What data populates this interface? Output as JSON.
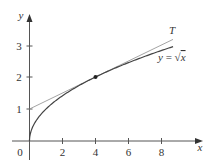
{
  "chart_data": {
    "type": "line",
    "title": "",
    "xlabel": "x",
    "ylabel": "y",
    "xlim": [
      0,
      9
    ],
    "ylim": [
      0,
      3.5
    ],
    "x_ticks": [
      "2",
      "4",
      "6",
      "8"
    ],
    "y_ticks": [
      "1",
      "2",
      "3"
    ],
    "origin_label": "0",
    "grid": false,
    "series": [
      {
        "name": "y = √x",
        "function": "sqrt(x)",
        "x_range": [
          0,
          8.7
        ],
        "style": "solid dark"
      },
      {
        "name": "T",
        "function": "x/4 + 1",
        "x_range": [
          0,
          8.7
        ],
        "style": "solid light",
        "description": "tangent line at (4, 2)"
      }
    ],
    "points": [
      {
        "x": 4,
        "y": 2,
        "label": ""
      }
    ],
    "annotations": [
      {
        "text": "T",
        "near": "tangent line end"
      },
      {
        "text": "y = √x",
        "near": "curve end"
      }
    ]
  },
  "labels": {
    "x_axis": "x",
    "y_axis": "y",
    "origin": "0",
    "xt": [
      "2",
      "4",
      "6",
      "8"
    ],
    "yt": [
      "1",
      "2",
      "3"
    ],
    "tangent": "T",
    "curve_y": "y",
    "curve_eq": "= ",
    "curve_x": "x"
  }
}
